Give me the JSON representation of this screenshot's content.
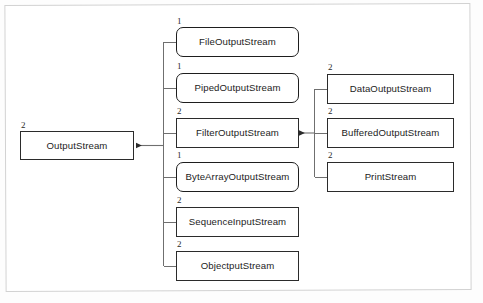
{
  "diagram": {
    "stroke_color": "#2b2b2b",
    "frame_color": "#d2d2d2",
    "background": "#ffffff"
  },
  "root": {
    "label": "OutputStream",
    "multiplicity": "2",
    "shape": "square"
  },
  "subclasses": [
    {
      "label": "FileOutputStream",
      "multiplicity": "1",
      "shape": "rounded"
    },
    {
      "label": "PipedOutputStream",
      "multiplicity": "1",
      "shape": "rounded"
    },
    {
      "label": "FilterOutputStream",
      "multiplicity": "2",
      "shape": "square"
    },
    {
      "label": "ByteArrayOutputStream",
      "multiplicity": "1",
      "shape": "rounded"
    },
    {
      "label": "SequenceInputStream",
      "multiplicity": "2",
      "shape": "square"
    },
    {
      "label": "ObjectputStream",
      "multiplicity": "2",
      "shape": "square"
    }
  ],
  "filter_subclasses": [
    {
      "label": "DataOutputStream",
      "multiplicity": "2",
      "shape": "square"
    },
    {
      "label": "BufferedOutputStream",
      "multiplicity": "2",
      "shape": "square"
    },
    {
      "label": "PrintStream",
      "multiplicity": "2",
      "shape": "square"
    }
  ]
}
